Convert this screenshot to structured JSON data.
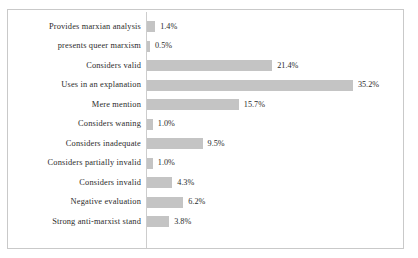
{
  "chart_data": {
    "type": "bar",
    "orientation": "horizontal",
    "title": "",
    "subtitle": "",
    "xlabel": "",
    "ylabel": "",
    "grid": false,
    "legend": false,
    "axis_line": true,
    "value_suffix": "%",
    "xlim": [
      0,
      35.2
    ],
    "px_per_unit": 5.85,
    "bar_color": "#c4c4c4",
    "frame_color": "#c9c9c9",
    "axis_color": "#cdcdcd",
    "text_color": "#2b2b2b",
    "categories": [
      "Provides marxian analysis",
      "presents queer marxism",
      "Considers valid",
      "Uses in an explanation",
      "Mere mention",
      "Considers waning",
      "Considers inadequate",
      "Considers partially invalid",
      "Considers invalid",
      "Negative evaluation",
      "Strong anti-marxist stand"
    ],
    "values": [
      1.4,
      0.5,
      21.4,
      35.2,
      15.7,
      1.0,
      9.5,
      1.0,
      4.3,
      6.2,
      3.8
    ],
    "value_labels": [
      "1.4%",
      "0.5%",
      "21.4%",
      "35.2%",
      "15.7%",
      "1.0%",
      "9.5%",
      "1.0%",
      "4.3%",
      "6.2%",
      "3.8%"
    ]
  }
}
